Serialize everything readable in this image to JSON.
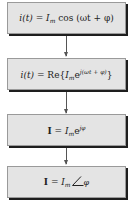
{
  "diagram": {
    "type": "flowchart",
    "direction": "top-to-bottom",
    "colors": {
      "box_fill": "#e4e4e4",
      "box_border": "#9a9a9a",
      "box_shadow": "#1e1e1e",
      "arrow": "#555555",
      "text": "#222222"
    },
    "steps": [
      {
        "label": "i(t) = I_m cos(ωt + φ)",
        "parts": {
          "lhs": "i(t)",
          "eq": " = ",
          "I": "I",
          "m": "m",
          "rest": " cos (ωt + φ)"
        }
      },
      {
        "label": "i(t) = Re{I_m e^{j(ωt + φ)}}",
        "parts": {
          "lhs": "i(t)",
          "eq": " = Re{",
          "I": "I",
          "m": "m",
          "e": "e",
          "exp": "j(ωt + φ)",
          "close": "}"
        }
      },
      {
        "label": "I = I_m e^{jφ}",
        "parts": {
          "bold": "I",
          "eq": " = ",
          "I": "I",
          "m": "m",
          "e": "e",
          "exp": "jφ"
        }
      },
      {
        "label": "I = I_m ∠φ",
        "parts": {
          "bold": "I",
          "eq": " = ",
          "I": "I",
          "m": "m",
          "phi": "φ"
        }
      }
    ]
  }
}
